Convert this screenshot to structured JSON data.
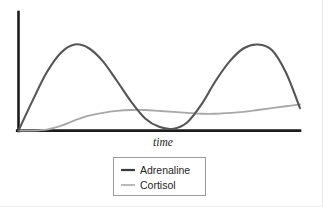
{
  "chart_data": {
    "type": "line",
    "title": "",
    "subtitle": "",
    "xlabel": "time",
    "ylabel": "",
    "grid": false,
    "legend_position": "bottom-center",
    "axis": {
      "x_axis_visible": true,
      "y_axis_visible": true,
      "x_ticks": [],
      "y_ticks": [],
      "xlim": [
        0,
        100
      ],
      "ylim": [
        0,
        100
      ],
      "x_tick_labels": [],
      "y_tick_labels": []
    },
    "x": [
      0,
      5,
      10,
      15,
      20,
      25,
      30,
      35,
      40,
      45,
      50,
      55,
      60,
      65,
      70,
      75,
      80,
      85,
      90,
      95,
      100
    ],
    "series": [
      {
        "name": "Adrenaline",
        "color": "#555555",
        "stroke_width": 2.1,
        "values": [
          0,
          32,
          62,
          83,
          92,
          88,
          74,
          53,
          31,
          13,
          4,
          2,
          9,
          28,
          53,
          74,
          88,
          92,
          86,
          62,
          24
        ]
      },
      {
        "name": "Cortisol",
        "color": "#a8a8a8",
        "stroke_width": 1.8,
        "values": [
          0,
          0,
          1,
          5,
          11,
          16,
          19,
          21,
          22,
          22,
          21,
          20,
          19,
          18,
          18,
          19,
          20,
          22,
          24,
          26,
          28
        ]
      }
    ],
    "annotations": []
  },
  "legend": {
    "entries": [
      {
        "label": "Adrenaline",
        "color": "#3a3a3a"
      },
      {
        "label": "Cortisol",
        "color": "#b2b2b2"
      }
    ]
  },
  "axis_labels": {
    "x": "time"
  }
}
